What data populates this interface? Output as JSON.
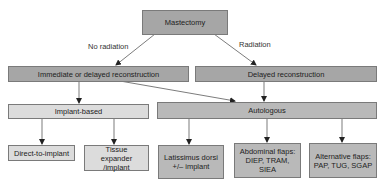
{
  "diagram": {
    "root": {
      "label": "Mastectomy"
    },
    "edge_labels": {
      "left": "No radiation",
      "right": "Radiation"
    },
    "level2": [
      {
        "label": "Immediate or delayed reconstruction"
      },
      {
        "label": "Delayed reconstruction"
      }
    ],
    "level3": [
      {
        "label": "Implant-based"
      },
      {
        "label": "Autologous"
      }
    ],
    "leaves": [
      {
        "label": "Direct-to-implant"
      },
      {
        "label": "Tissue expander /implant"
      },
      {
        "label": "Latissimus dorsi +/– implant"
      },
      {
        "label": "Abdominal flaps: DIEP, TRAM, SIEA"
      },
      {
        "label": "Alternative flaps: PAP, TUG, SGAP"
      }
    ],
    "colors": {
      "dark": "#a6a6a6",
      "mid": "#b9b9b9",
      "light": "#dcdcdc",
      "border": "#7a7a7a",
      "line": "#333333"
    }
  }
}
